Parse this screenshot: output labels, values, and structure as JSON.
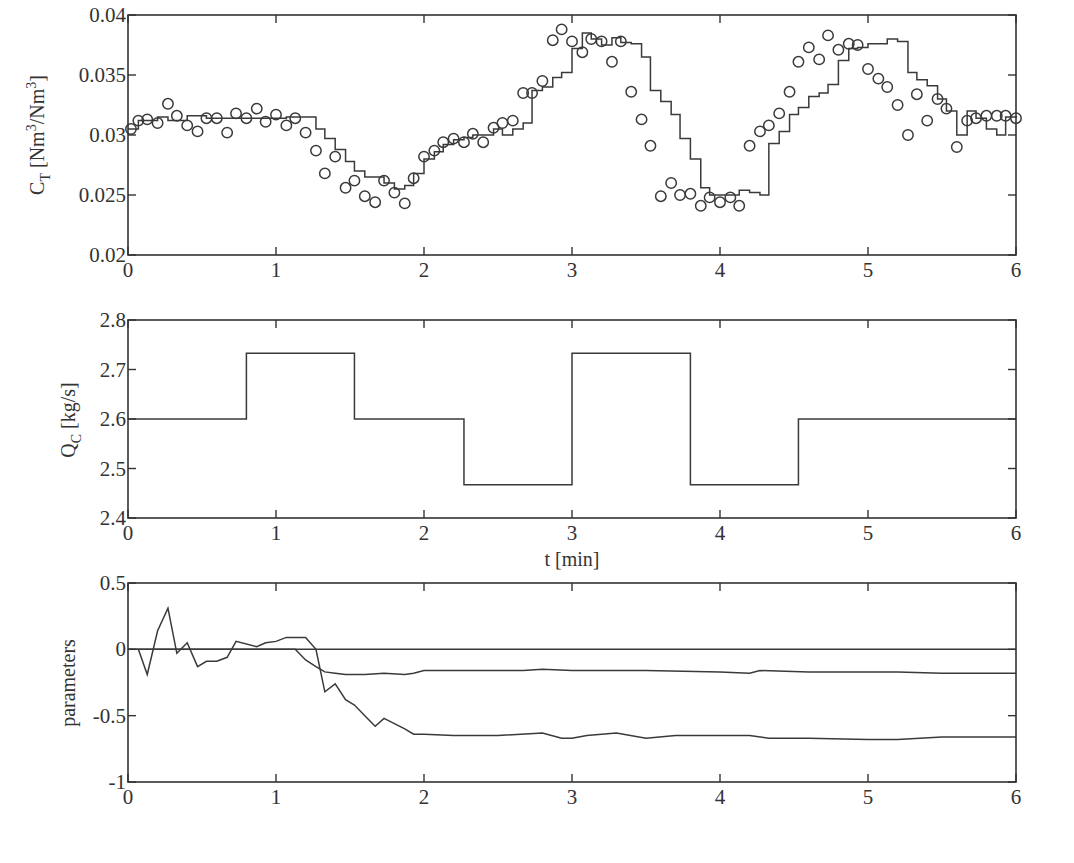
{
  "chart_data": [
    {
      "id": "ct",
      "type": "line",
      "title": "",
      "xlabel": "",
      "ylabel": "C_T [Nm^3/Nm^3]",
      "ylabel_parts": {
        "main": "C",
        "sub": "T",
        "unit": " [Nm",
        "sup1": "3",
        "mid": "/Nm",
        "sup2": "3",
        "end": "]"
      },
      "xlim": [
        0,
        6
      ],
      "ylim": [
        0.02,
        0.04
      ],
      "xticks": [
        "0",
        "1",
        "2",
        "3",
        "4",
        "5",
        "6"
      ],
      "yticks": [
        "0.02",
        "0.025",
        "0.03",
        "0.035",
        "0.04"
      ],
      "grid": false,
      "series": [
        {
          "name": "model (stairs)",
          "style": "step",
          "x": [
            0,
            0.07,
            0.2,
            0.27,
            0.4,
            0.53,
            0.67,
            0.8,
            0.93,
            1.07,
            1.2,
            1.27,
            1.33,
            1.4,
            1.47,
            1.53,
            1.6,
            1.67,
            1.73,
            1.8,
            1.87,
            1.93,
            2.0,
            2.07,
            2.13,
            2.2,
            2.27,
            2.33,
            2.4,
            2.47,
            2.53,
            2.6,
            2.67,
            2.73,
            2.8,
            2.87,
            2.93,
            3.0,
            3.07,
            3.13,
            3.2,
            3.27,
            3.33,
            3.4,
            3.47,
            3.53,
            3.6,
            3.67,
            3.73,
            3.8,
            3.87,
            3.93,
            4.0,
            4.07,
            4.13,
            4.2,
            4.27,
            4.33,
            4.4,
            4.47,
            4.53,
            4.6,
            4.67,
            4.73,
            4.8,
            4.87,
            4.93,
            5.0,
            5.07,
            5.13,
            5.2,
            5.27,
            5.33,
            5.4,
            5.47,
            5.53,
            5.6,
            5.67,
            5.73,
            5.8,
            5.87,
            5.93,
            6.0
          ],
          "values": [
            0.0305,
            0.0312,
            0.0315,
            0.0312,
            0.0316,
            0.0314,
            0.0314,
            0.0314,
            0.0314,
            0.0315,
            0.0315,
            0.0305,
            0.0297,
            0.0288,
            0.0278,
            0.027,
            0.0265,
            0.0265,
            0.026,
            0.0255,
            0.0258,
            0.0268,
            0.028,
            0.0286,
            0.0292,
            0.0296,
            0.0298,
            0.03,
            0.03,
            0.0305,
            0.03,
            0.0305,
            0.031,
            0.0337,
            0.034,
            0.0348,
            0.0352,
            0.0372,
            0.0385,
            0.038,
            0.0375,
            0.0381,
            0.0377,
            0.0376,
            0.0365,
            0.0337,
            0.0328,
            0.0317,
            0.0297,
            0.028,
            0.0256,
            0.025,
            0.025,
            0.025,
            0.0254,
            0.0252,
            0.025,
            0.0293,
            0.0303,
            0.0317,
            0.0323,
            0.0332,
            0.0335,
            0.0342,
            0.0362,
            0.0372,
            0.0373,
            0.0376,
            0.0376,
            0.038,
            0.0378,
            0.0352,
            0.0346,
            0.0341,
            0.033,
            0.032,
            0.03,
            0.032,
            0.0314,
            0.0305,
            0.03,
            0.0315,
            0.0316,
            0.0316,
            0.0316,
            0.0316,
            0.0316
          ]
        },
        {
          "name": "measured (circles)",
          "style": "markers",
          "x": [
            0.02,
            0.07,
            0.13,
            0.2,
            0.27,
            0.33,
            0.4,
            0.47,
            0.53,
            0.6,
            0.67,
            0.73,
            0.8,
            0.87,
            0.93,
            1.0,
            1.07,
            1.13,
            1.2,
            1.27,
            1.33,
            1.4,
            1.47,
            1.53,
            1.6,
            1.67,
            1.73,
            1.8,
            1.87,
            1.93,
            2.0,
            2.07,
            2.13,
            2.2,
            2.27,
            2.33,
            2.4,
            2.47,
            2.53,
            2.6,
            2.67,
            2.73,
            2.8,
            2.87,
            2.93,
            3.0,
            3.07,
            3.13,
            3.2,
            3.27,
            3.33,
            3.4,
            3.47,
            3.53,
            3.6,
            3.67,
            3.73,
            3.8,
            3.87,
            3.93,
            4.0,
            4.07,
            4.13,
            4.2,
            4.27,
            4.33,
            4.4,
            4.47,
            4.53,
            4.6,
            4.67,
            4.73,
            4.8,
            4.87,
            4.93,
            5.0,
            5.07,
            5.13,
            5.2,
            5.27,
            5.33,
            5.4,
            5.47,
            5.53,
            5.6,
            5.67,
            5.73,
            5.8,
            5.87,
            5.93,
            6.0
          ],
          "values": [
            0.0305,
            0.0312,
            0.0313,
            0.031,
            0.0326,
            0.0316,
            0.0308,
            0.0303,
            0.0314,
            0.0314,
            0.0302,
            0.0318,
            0.0314,
            0.0322,
            0.0311,
            0.0317,
            0.0308,
            0.0314,
            0.0302,
            0.0287,
            0.0268,
            0.0282,
            0.0256,
            0.0262,
            0.0249,
            0.0244,
            0.0262,
            0.0252,
            0.0243,
            0.0264,
            0.0282,
            0.0287,
            0.0294,
            0.0297,
            0.0294,
            0.0301,
            0.0294,
            0.0306,
            0.031,
            0.0312,
            0.0335,
            0.0335,
            0.0345,
            0.0379,
            0.0388,
            0.0378,
            0.0369,
            0.038,
            0.0378,
            0.0361,
            0.0378,
            0.0336,
            0.0313,
            0.0291,
            0.0249,
            0.026,
            0.025,
            0.0251,
            0.0241,
            0.0248,
            0.0244,
            0.0248,
            0.0241,
            0.0291,
            0.0303,
            0.0308,
            0.0318,
            0.0336,
            0.0361,
            0.0373,
            0.0363,
            0.0383,
            0.0371,
            0.0376,
            0.0375,
            0.0355,
            0.0347,
            0.034,
            0.0325,
            0.03,
            0.0334,
            0.0312,
            0.033,
            0.0322,
            0.029,
            0.0312,
            0.0314,
            0.0316,
            0.0316,
            0.0316,
            0.0314,
            0.0316
          ]
        }
      ]
    },
    {
      "id": "qc",
      "type": "line",
      "title": "",
      "xlabel": "t [min]",
      "ylabel": "Q_C [kg/s]",
      "ylabel_parts": {
        "main": "Q",
        "sub": "C",
        "unit": " [kg/s]"
      },
      "xlim": [
        0,
        6
      ],
      "ylim": [
        2.4,
        2.8
      ],
      "xticks": [
        "0",
        "1",
        "2",
        "3",
        "4",
        "5",
        "6"
      ],
      "yticks": [
        "2.4",
        "2.5",
        "2.6",
        "2.7",
        "2.8"
      ],
      "grid": false,
      "series": [
        {
          "name": "Q_C input",
          "style": "step",
          "x": [
            0,
            0.8,
            1.53,
            2.27,
            3.0,
            3.8,
            4.53,
            6.0
          ],
          "values": [
            2.6,
            2.733,
            2.6,
            2.467,
            2.733,
            2.467,
            2.6,
            2.6
          ]
        }
      ]
    },
    {
      "id": "params",
      "type": "line",
      "title": "",
      "xlabel": "",
      "ylabel": "parameters",
      "xlim": [
        0,
        6
      ],
      "ylim": [
        -1,
        0.5
      ],
      "xticks": [
        "0",
        "1",
        "2",
        "3",
        "4",
        "5",
        "6"
      ],
      "yticks": [
        "-1",
        "-0.5",
        "0",
        "0.5"
      ],
      "grid": false,
      "series": [
        {
          "name": "parameter 1 (zero)",
          "x": [
            0,
            6
          ],
          "values": [
            0,
            0
          ]
        },
        {
          "name": "parameter 2",
          "x": [
            0,
            1.13,
            1.2,
            1.27,
            1.33,
            1.4,
            1.47,
            1.6,
            1.73,
            1.87,
            1.93,
            2.0,
            2.2,
            2.4,
            2.67,
            2.8,
            3.0,
            3.3,
            3.5,
            4.0,
            4.2,
            4.27,
            4.6,
            5.0,
            5.2,
            5.5,
            6.0
          ],
          "values": [
            0,
            0,
            -0.08,
            -0.13,
            -0.17,
            -0.18,
            -0.19,
            -0.19,
            -0.18,
            -0.19,
            -0.18,
            -0.16,
            -0.16,
            -0.16,
            -0.16,
            -0.15,
            -0.16,
            -0.16,
            -0.16,
            -0.17,
            -0.18,
            -0.16,
            -0.17,
            -0.17,
            -0.17,
            -0.18,
            -0.18
          ]
        },
        {
          "name": "parameter 3",
          "x": [
            0.07,
            0.13,
            0.2,
            0.27,
            0.33,
            0.4,
            0.47,
            0.53,
            0.6,
            0.67,
            0.73,
            0.87,
            0.93,
            1.0,
            1.07,
            1.2,
            1.27,
            1.33,
            1.4,
            1.47,
            1.53,
            1.6,
            1.67,
            1.73,
            1.87,
            1.93,
            2.0,
            2.2,
            2.5,
            2.8,
            2.93,
            3.0,
            3.1,
            3.3,
            3.5,
            3.7,
            4.0,
            4.2,
            4.33,
            4.6,
            5.0,
            5.2,
            5.5,
            6.0
          ],
          "values": [
            0,
            -0.19,
            0.14,
            0.31,
            -0.03,
            0.05,
            -0.13,
            -0.09,
            -0.09,
            -0.06,
            0.06,
            0.02,
            0.05,
            0.06,
            0.09,
            0.09,
            0.0,
            -0.32,
            -0.26,
            -0.38,
            -0.42,
            -0.5,
            -0.58,
            -0.52,
            -0.6,
            -0.64,
            -0.64,
            -0.65,
            -0.65,
            -0.63,
            -0.67,
            -0.67,
            -0.65,
            -0.63,
            -0.67,
            -0.65,
            -0.65,
            -0.65,
            -0.67,
            -0.67,
            -0.68,
            -0.68,
            -0.66,
            -0.66
          ]
        }
      ]
    }
  ]
}
